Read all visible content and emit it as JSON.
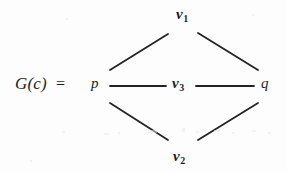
{
  "figure": {
    "type": "graph-diagram",
    "background_color": "#fdfdfd",
    "ink_color": "#232323",
    "equation": {
      "lhs": "G(c)",
      "equals": "="
    },
    "vertices": [
      {
        "id": "p",
        "label": "p",
        "sub": "",
        "x": 95,
        "y": 86,
        "style": "italic"
      },
      {
        "id": "v1",
        "label": "v",
        "sub": "1",
        "x": 183,
        "y": 15,
        "style": "bold-italic"
      },
      {
        "id": "v3",
        "label": "v",
        "sub": "3",
        "x": 180,
        "y": 86,
        "style": "bold-italic"
      },
      {
        "id": "v2",
        "label": "v",
        "sub": "2",
        "x": 181,
        "y": 158,
        "style": "bold-italic"
      },
      {
        "id": "q",
        "label": "q",
        "sub": "",
        "x": 265,
        "y": 86,
        "style": "italic"
      }
    ],
    "edges": [
      {
        "from": "p",
        "to": "v1",
        "x1": 110,
        "y1": 70,
        "x2": 168,
        "y2": 34
      },
      {
        "from": "v1",
        "to": "q",
        "x1": 198,
        "y1": 33,
        "x2": 258,
        "y2": 70
      },
      {
        "from": "p",
        "to": "v3",
        "x1": 110,
        "y1": 86,
        "x2": 166,
        "y2": 86
      },
      {
        "from": "v3",
        "to": "q",
        "x1": 196,
        "y1": 86,
        "x2": 254,
        "y2": 86
      },
      {
        "from": "p",
        "to": "v2",
        "x1": 110,
        "y1": 103,
        "x2": 168,
        "y2": 140
      },
      {
        "from": "v2",
        "to": "q",
        "x1": 198,
        "y1": 140,
        "x2": 258,
        "y2": 103
      }
    ],
    "edge_stroke_width": 1.8,
    "speckles": [
      {
        "x": 62,
        "y": 131,
        "w": 3,
        "h": 2
      },
      {
        "x": 104,
        "y": 133,
        "w": 5,
        "h": 2
      },
      {
        "x": 118,
        "y": 132,
        "w": 2,
        "h": 2
      },
      {
        "x": 148,
        "y": 130,
        "w": 9,
        "h": 3
      },
      {
        "x": 163,
        "y": 134,
        "w": 4,
        "h": 2
      },
      {
        "x": 182,
        "y": 128,
        "w": 3,
        "h": 4
      },
      {
        "x": 196,
        "y": 131,
        "w": 3,
        "h": 2
      },
      {
        "x": 214,
        "y": 130,
        "w": 6,
        "h": 2
      },
      {
        "x": 232,
        "y": 132,
        "w": 3,
        "h": 2
      },
      {
        "x": 252,
        "y": 130,
        "w": 4,
        "h": 2
      },
      {
        "x": 268,
        "y": 132,
        "w": 3,
        "h": 2
      },
      {
        "x": 66,
        "y": 18,
        "w": 2,
        "h": 2
      },
      {
        "x": 252,
        "y": 14,
        "w": 2,
        "h": 2
      },
      {
        "x": 30,
        "y": 160,
        "w": 2,
        "h": 2
      }
    ]
  }
}
